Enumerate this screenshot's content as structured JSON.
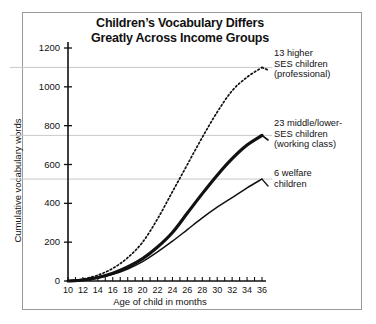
{
  "figure": {
    "title": "Children’s Vocabulary Differs\nGreatly Across Income Groups",
    "border_color": "#9a9a9a",
    "background": "#ffffff",
    "ink_color": "#111111",
    "gridline_color": "#c9c9c9"
  },
  "axes": {
    "ylabel": "Cumulative vocabulary words",
    "xlabel": "Age of child in months"
  },
  "legend": {
    "items": [
      {
        "name": "higher-ses",
        "label": "13 higher\nSES children\n(professional)"
      },
      {
        "name": "middle-lower-ses",
        "label": "23 middle/lower-\nSES children\n(working class)"
      },
      {
        "name": "welfare",
        "label": "6 welfare\nchildren"
      }
    ]
  },
  "chart_data": {
    "type": "line",
    "title": "Children’s Vocabulary Differs Greatly Across Income Groups",
    "xlabel": "Age of child in months",
    "ylabel": "Cumulative vocabulary words",
    "xlim": [
      10,
      36
    ],
    "ylim": [
      0,
      1200
    ],
    "xticks": [
      10,
      11,
      12,
      13,
      14,
      15,
      16,
      17,
      18,
      19,
      20,
      21,
      22,
      23,
      24,
      25,
      26,
      27,
      28,
      29,
      30,
      31,
      32,
      33,
      34,
      35,
      36
    ],
    "xticklabels": [
      10,
      12,
      14,
      16,
      18,
      20,
      22,
      24,
      26,
      28,
      30,
      32,
      34,
      36
    ],
    "yticks": [
      0,
      200,
      400,
      600,
      800,
      1000,
      1200
    ],
    "yticklabels": [
      "0",
      "200",
      "400",
      "600",
      "800",
      "1000",
      "1200"
    ],
    "grid": "horizontal reference lines at final values of each series",
    "reference_lines": [
      1100,
      750,
      525
    ],
    "legend_position": "right, annotated at series endpoints",
    "x": [
      10,
      12,
      14,
      16,
      18,
      20,
      22,
      24,
      26,
      28,
      30,
      32,
      34,
      36
    ],
    "series": [
      {
        "name": "13 higher SES children (professional)",
        "style": "dotted",
        "values": [
          0,
          10,
          30,
          65,
          120,
          200,
          320,
          460,
          600,
          740,
          870,
          980,
          1050,
          1100
        ]
      },
      {
        "name": "23 middle/lower-SES children (working class)",
        "style": "thick-solid",
        "values": [
          0,
          5,
          18,
          40,
          72,
          115,
          175,
          250,
          350,
          450,
          545,
          630,
          700,
          750
        ]
      },
      {
        "name": "6 welfare children",
        "style": "thin-solid",
        "values": [
          0,
          4,
          15,
          34,
          62,
          100,
          150,
          205,
          265,
          325,
          380,
          430,
          480,
          525
        ]
      }
    ]
  }
}
